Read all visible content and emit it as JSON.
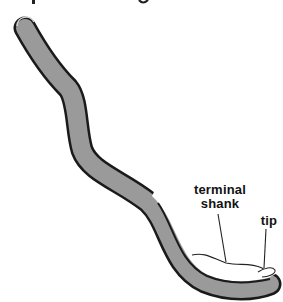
{
  "figure": {
    "title_visible": false,
    "labels": {
      "terminal_shank_line1": "terminal",
      "terminal_shank_line2": "shank",
      "tip": "tip"
    },
    "colors": {
      "shaft_fill": "#9a9a9a",
      "shaft_outline": "#1a1a1a",
      "background": "#ffffff",
      "leader_line": "#222222"
    }
  }
}
